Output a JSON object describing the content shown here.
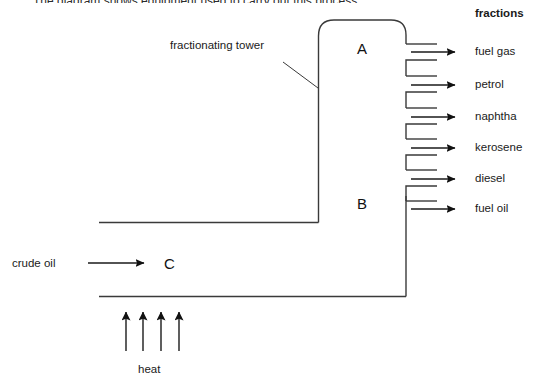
{
  "page": {
    "width": 547,
    "height": 392,
    "background": "#ffffff",
    "line_color": "#2b2b2b",
    "text_color": "#1a1a1a",
    "intro_text": "The diagram shows equipment used to carry out this process."
  },
  "diagram": {
    "title_label": "fractions",
    "tower_label": "fractionating tower",
    "feed_label": "crude oil",
    "heat_label": "heat",
    "zone_labels": {
      "top": "A",
      "bottom": "B",
      "furnace": "C"
    },
    "fractions": [
      {
        "name": "fuel gas",
        "y": 52
      },
      {
        "name": "petrol",
        "y": 85
      },
      {
        "name": "naphtha",
        "y": 117
      },
      {
        "name": "kerosene",
        "y": 148
      },
      {
        "name": "diesel",
        "y": 179
      },
      {
        "name": "fuel oil",
        "y": 209
      }
    ],
    "heat_arrows": 4
  }
}
